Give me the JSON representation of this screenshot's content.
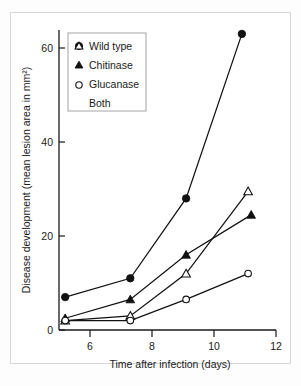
{
  "chart_data": {
    "type": "line",
    "title": "",
    "xlabel": "Time after infection (days)",
    "ylabel": "Disease development (mean lesion area in mm²)",
    "xlim": [
      4.6,
      12.4
    ],
    "ylim": [
      0,
      66
    ],
    "xticks": [
      6,
      8,
      10,
      12
    ],
    "yticks": [
      0,
      20,
      40,
      60
    ],
    "xtick_labels": [
      "6",
      "8",
      "10",
      "12"
    ],
    "ytick_labels": [
      "0",
      "20",
      "40",
      "60"
    ],
    "grid": false,
    "legend_position": "upper-left-inside",
    "series": [
      {
        "name": "Wild type",
        "marker": "filled-circle",
        "color": "#111111",
        "x": [
          5.2,
          7.3,
          9.1,
          10.9
        ],
        "values": [
          7,
          11,
          28,
          63
        ]
      },
      {
        "name": "Chitinase",
        "marker": "open-triangle",
        "color": "#111111",
        "x": [
          5.2,
          7.3,
          9.1,
          11.1
        ],
        "values": [
          2,
          3,
          12,
          29.5
        ]
      },
      {
        "name": "Glucanase",
        "marker": "filled-triangle",
        "color": "#111111",
        "x": [
          5.2,
          7.3,
          9.1,
          11.2
        ],
        "values": [
          2.5,
          6.5,
          16,
          24.5
        ]
      },
      {
        "name": "Both",
        "marker": "open-circle",
        "color": "#111111",
        "x": [
          5.2,
          7.3,
          9.1,
          11.1
        ],
        "values": [
          2,
          2,
          6.5,
          12
        ]
      }
    ]
  },
  "legend": {
    "entries": [
      {
        "label": "Wild type",
        "marker": "filled-circle"
      },
      {
        "label": "Chitinase",
        "marker": "open-triangle"
      },
      {
        "label": "Glucanase",
        "marker": "filled-triangle"
      },
      {
        "label": "Both",
        "marker": "open-circle"
      }
    ]
  }
}
